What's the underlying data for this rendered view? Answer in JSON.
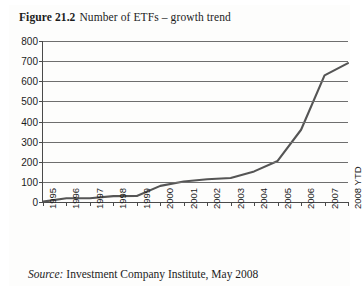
{
  "figure": {
    "label": "Figure 21.2",
    "title": "Number of ETFs – growth trend"
  },
  "source": {
    "label": "Source:",
    "text": "Investment Company Institute, May 2008"
  },
  "chart_data": {
    "type": "line",
    "title": "Number of ETFs – growth trend",
    "xlabel": "",
    "ylabel": "",
    "ylim": [
      0,
      800
    ],
    "ytick_labels": [
      "0",
      "100",
      "200",
      "300",
      "400",
      "500",
      "600",
      "700",
      "800"
    ],
    "yticks": [
      0,
      100,
      200,
      300,
      400,
      500,
      600,
      700,
      800
    ],
    "grid": true,
    "legend": false,
    "categories": [
      "1995",
      "1996",
      "1997",
      "1998",
      "1999",
      "2000",
      "2001",
      "2002",
      "2003",
      "2004",
      "2005",
      "2006",
      "2007",
      "2008 YTD"
    ],
    "values": [
      2,
      19,
      19,
      29,
      30,
      80,
      102,
      113,
      119,
      152,
      204,
      359,
      629,
      690
    ],
    "line_color": "#555555"
  }
}
